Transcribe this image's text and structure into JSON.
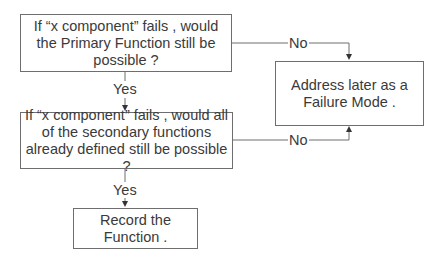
{
  "diagram": {
    "type": "flowchart",
    "nodes": {
      "q1": {
        "text": "If “x component” fails , would the Primary Function still be possible ?"
      },
      "q2": {
        "text": "If “x component” fails , would all of the secondary functions already defined still be possible ?"
      },
      "failure": {
        "text": "Address later as a Failure Mode ."
      },
      "record": {
        "text": "Record the Function ."
      }
    },
    "edges": {
      "q1_yes": {
        "label": "Yes"
      },
      "q1_no": {
        "label": "No"
      },
      "q2_yes": {
        "label": "Yes"
      },
      "q2_no": {
        "label": "No"
      }
    },
    "colors": {
      "line": "#6e6e6e",
      "text": "#3a3a3a",
      "background": "#ffffff"
    }
  }
}
